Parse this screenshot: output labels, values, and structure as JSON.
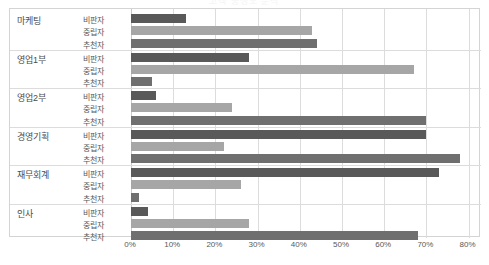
{
  "chart_title": "고객 충성도 분석",
  "axis": {
    "x_ticks": [
      "0%",
      "10%",
      "20%",
      "30%",
      "40%",
      "50%",
      "60%",
      "70%",
      "80%"
    ],
    "x_min": 0,
    "x_max": 80,
    "x_step": 10
  },
  "series_names": [
    "비판자",
    "중립자",
    "추천자"
  ],
  "colors": {
    "critic": "#595959",
    "neutral": "#a6a6a6",
    "promoter": "#6f6f6f",
    "gridline": "#dcdcdc",
    "frame": "#d4d4d4",
    "label_text": "#4b4b4b",
    "series_text": "#5a5a5a"
  },
  "chart_data": {
    "type": "bar",
    "orientation": "horizontal",
    "title": "고객 충성도 분석",
    "xlabel": "",
    "ylabel": "",
    "xlim": [
      0,
      80
    ],
    "grid": true,
    "legend": "none",
    "categories": [
      "마케팅",
      "영업1부",
      "영업2부",
      "경영기획",
      "재무회계",
      "인사"
    ],
    "subcategories": [
      "비판자",
      "중립자",
      "추천자"
    ],
    "series": [
      {
        "name": "비판자",
        "values": [
          13,
          28,
          6,
          70,
          73,
          4
        ]
      },
      {
        "name": "중립자",
        "values": [
          43,
          67,
          24,
          22,
          26,
          28
        ]
      },
      {
        "name": "추천자",
        "values": [
          44,
          5,
          70,
          78,
          2,
          68
        ]
      }
    ]
  },
  "groups": [
    {
      "name": "마케팅",
      "rows": [
        {
          "label": "비판자",
          "value": 13,
          "series": "critic"
        },
        {
          "label": "중립자",
          "value": 43,
          "series": "neutral"
        },
        {
          "label": "추천자",
          "value": 44,
          "series": "promoter"
        }
      ]
    },
    {
      "name": "영업1부",
      "rows": [
        {
          "label": "비판자",
          "value": 28,
          "series": "critic"
        },
        {
          "label": "중립자",
          "value": 67,
          "series": "neutral"
        },
        {
          "label": "추천자",
          "value": 5,
          "series": "promoter"
        }
      ]
    },
    {
      "name": "영업2부",
      "rows": [
        {
          "label": "비판자",
          "value": 6,
          "series": "critic"
        },
        {
          "label": "중립자",
          "value": 24,
          "series": "neutral"
        },
        {
          "label": "추천자",
          "value": 70,
          "series": "promoter"
        }
      ]
    },
    {
      "name": "경영기획",
      "rows": [
        {
          "label": "비판자",
          "value": 70,
          "series": "critic"
        },
        {
          "label": "중립자",
          "value": 22,
          "series": "neutral"
        },
        {
          "label": "추천자",
          "value": 78,
          "series": "promoter"
        }
      ]
    },
    {
      "name": "재무회계",
      "rows": [
        {
          "label": "비판자",
          "value": 73,
          "series": "critic"
        },
        {
          "label": "중립자",
          "value": 26,
          "series": "neutral"
        },
        {
          "label": "추천자",
          "value": 2,
          "series": "promoter"
        }
      ]
    },
    {
      "name": "인사",
      "rows": [
        {
          "label": "비판자",
          "value": 4,
          "series": "critic"
        },
        {
          "label": "중립자",
          "value": 28,
          "series": "neutral"
        },
        {
          "label": "추천자",
          "value": 68,
          "series": "promoter"
        }
      ]
    }
  ]
}
